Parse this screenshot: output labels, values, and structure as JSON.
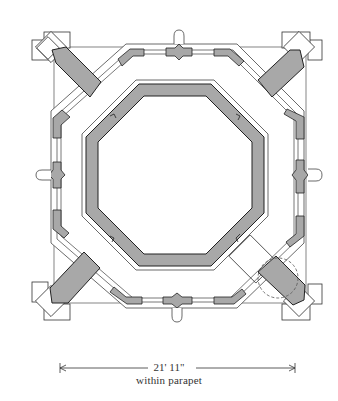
{
  "diagram": {
    "type": "architectural-plan",
    "colors": {
      "wall_fill": "#a8a8a8",
      "line": "#333333",
      "background": "#ffffff"
    },
    "dimension": {
      "value": "21' 11\"",
      "note": "within parapet"
    }
  }
}
